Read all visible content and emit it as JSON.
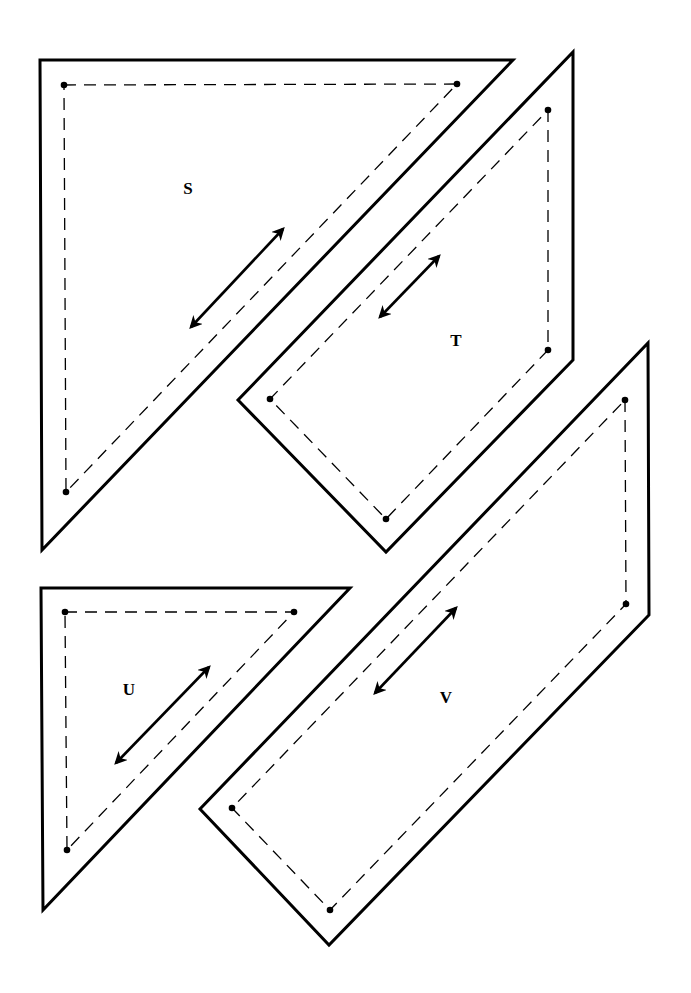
{
  "diagram": {
    "type": "quilt-pattern-pieces",
    "background": "#ffffff",
    "stroke_color": "#000000",
    "pieces": [
      {
        "id": "S",
        "label": "S",
        "label_pos": [
          188,
          194
        ],
        "outline": [
          [
            40,
            60
          ],
          [
            513,
            60
          ],
          [
            42,
            550
          ]
        ],
        "seam": [
          [
            64,
            85
          ],
          [
            457,
            84
          ],
          [
            66,
            492
          ]
        ],
        "seam_closed": true,
        "dots": [
          [
            64,
            85
          ],
          [
            457,
            84
          ],
          [
            66,
            492
          ]
        ],
        "grain_arrow": [
          [
            191,
            327
          ],
          [
            283,
            229
          ]
        ]
      },
      {
        "id": "T",
        "label": "T",
        "label_pos": [
          456,
          346
        ],
        "outline": [
          [
            573,
            52
          ],
          [
            573,
            360
          ],
          [
            386,
            552
          ],
          [
            238,
            400
          ]
        ],
        "seam": [
          [
            548,
            110
          ],
          [
            548,
            350
          ],
          [
            386,
            519
          ],
          [
            270,
            399
          ]
        ],
        "seam_closed": true,
        "dots": [
          [
            548,
            110
          ],
          [
            548,
            350
          ],
          [
            386,
            519
          ],
          [
            270,
            399
          ]
        ],
        "grain_arrow": [
          [
            380,
            317
          ],
          [
            439,
            256
          ]
        ]
      },
      {
        "id": "U",
        "label": "U",
        "label_pos": [
          129,
          695
        ],
        "outline": [
          [
            41,
            588
          ],
          [
            350,
            588
          ],
          [
            43,
            910
          ]
        ],
        "seam": [
          [
            65,
            612
          ],
          [
            294,
            612
          ],
          [
            67,
            850
          ]
        ],
        "seam_closed": true,
        "dots": [
          [
            65,
            612
          ],
          [
            294,
            612
          ],
          [
            67,
            850
          ]
        ],
        "grain_arrow": [
          [
            116,
            763
          ],
          [
            209,
            667
          ]
        ]
      },
      {
        "id": "V",
        "label": "V",
        "label_pos": [
          446,
          703
        ],
        "outline": [
          [
            648,
            343
          ],
          [
            649,
            615
          ],
          [
            329,
            945
          ],
          [
            200,
            809
          ]
        ],
        "seam": [
          [
            625,
            400
          ],
          [
            626,
            604
          ],
          [
            330,
            910
          ],
          [
            232,
            808
          ]
        ],
        "seam_closed": true,
        "dots": [
          [
            625,
            400
          ],
          [
            626,
            604
          ],
          [
            330,
            910
          ],
          [
            232,
            808
          ]
        ],
        "grain_arrow": [
          [
            375,
            693
          ],
          [
            456,
            608
          ]
        ]
      }
    ]
  }
}
